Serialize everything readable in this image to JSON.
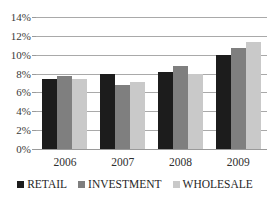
{
  "chart_data": {
    "type": "bar",
    "title": "",
    "subtitle": "",
    "xlabel": "",
    "ylabel": "",
    "categories": [
      "2006",
      "2007",
      "2008",
      "2009"
    ],
    "series": [
      {
        "name": "RETAIL",
        "color": "#1c1c1c",
        "values": [
          7.4,
          8.0,
          8.2,
          10.0
        ]
      },
      {
        "name": "INVESTMENT",
        "color": "#7f7f7f",
        "values": [
          7.7,
          6.8,
          8.8,
          10.7
        ]
      },
      {
        "name": "WHOLESALE",
        "color": "#c9c9c9",
        "values": [
          7.4,
          7.1,
          8.0,
          11.4
        ]
      }
    ],
    "ylim": [
      0,
      14
    ],
    "ytick_step": 2,
    "ytick_labels": [
      "0%",
      "2%",
      "4%",
      "6%",
      "8%",
      "10%",
      "12%",
      "14%"
    ],
    "ytick_values": [
      0,
      2,
      4,
      6,
      8,
      10,
      12,
      14
    ],
    "grid": true,
    "grid_color": "#a9a9a9",
    "legend_position": "bottom",
    "background": "#ffffff"
  },
  "legend": {
    "items": [
      {
        "label": "RETAIL",
        "color": "#1c1c1c"
      },
      {
        "label": "INVESTMENT",
        "color": "#7f7f7f"
      },
      {
        "label": "WHOLESALE",
        "color": "#c9c9c9"
      }
    ]
  }
}
